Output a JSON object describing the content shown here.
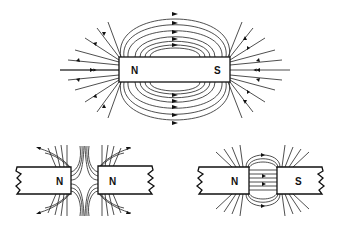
{
  "figure": {
    "panels": [
      {
        "id": "single-bar-magnet",
        "description": "Field lines of a single bar magnet",
        "poles": [
          "N",
          "S"
        ]
      },
      {
        "id": "like-poles",
        "description": "Two like poles facing each other (repulsion)",
        "poles": [
          "N",
          "N"
        ]
      },
      {
        "id": "unlike-poles",
        "description": "Two unlike poles facing each other (attraction)",
        "poles": [
          "N",
          "S"
        ]
      }
    ]
  },
  "labels": {
    "top_left": "N",
    "top_right": "S",
    "bl_left": "N",
    "bl_right": "N",
    "br_left": "N",
    "br_right": "S"
  },
  "colors": {
    "ink": "#111111",
    "background": "#ffffff"
  }
}
